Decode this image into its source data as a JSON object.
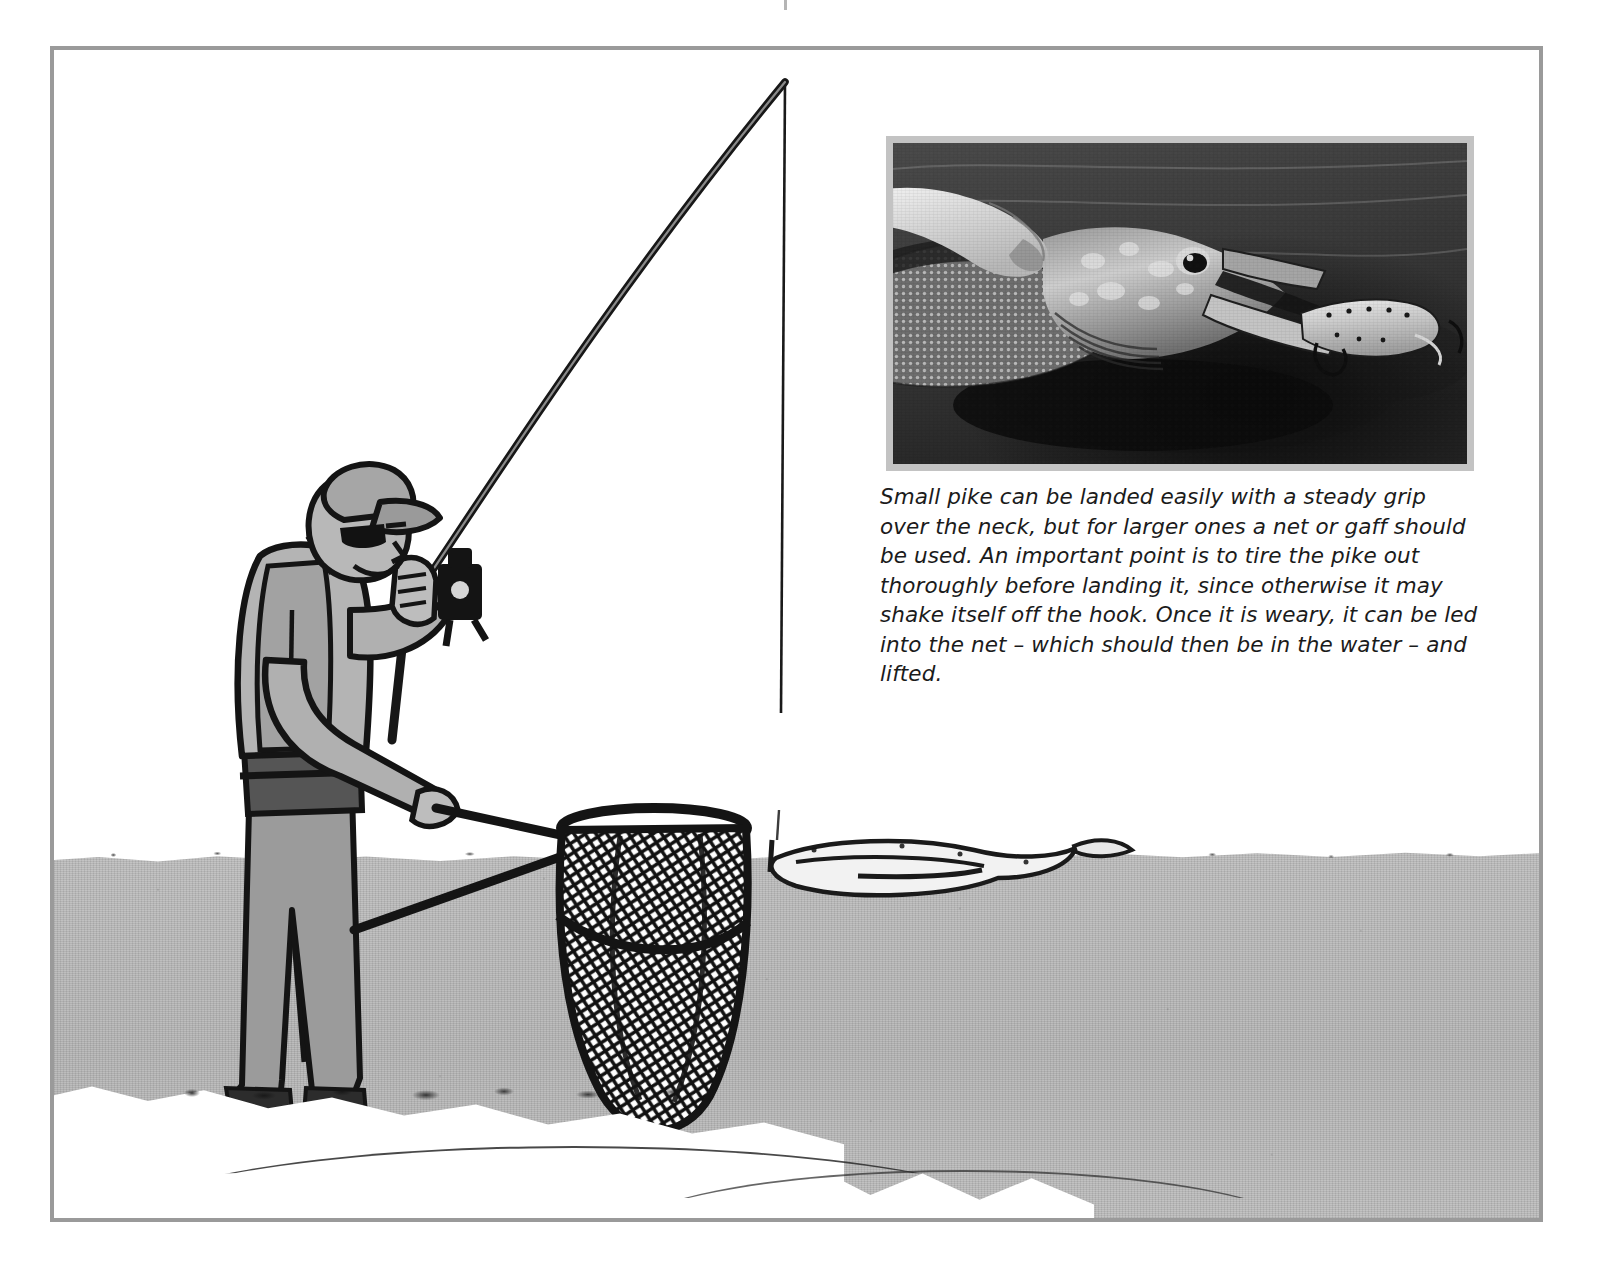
{
  "page": {
    "type": "book-page-illustration",
    "background_color": "#ffffff",
    "border_color": "#9a9a9a"
  },
  "illustration": {
    "name": "angler-landing-pike-illustration",
    "description": "Line-art illustration of an angler standing in shallow water, rod bent, holding a landing net, with a hooked pike splashing at the surface.",
    "elements": [
      "angler-figure",
      "fishing-rod",
      "fishing-line",
      "spinning-reel",
      "landing-net",
      "hooked-pike",
      "water-surface",
      "shoreline-foam"
    ],
    "colors": {
      "water": "#b8b8b8",
      "figure_fill": "#a9a9a9",
      "figure_shadow": "#8f8f8f",
      "outline": "#141414",
      "foam": "#ffffff"
    }
  },
  "photo": {
    "name": "pike-head-photograph",
    "alt": "Black and white photograph of a hand gripping a pike over the neck, with a plug lure hooked in its jaw, held just above the water.",
    "frame_color": "#c3c3c3",
    "tone": "monochrome"
  },
  "caption": {
    "text": "Small pike can be landed easily with a steady grip over the neck, but for larger ones a net or gaff should be used. An important point is to tire the pike out thoroughly before landing it, since otherwise it may shake itself off the hook. Once it is weary, it can be led into the net – which should then be in the water – and lifted.",
    "style": "italic"
  }
}
